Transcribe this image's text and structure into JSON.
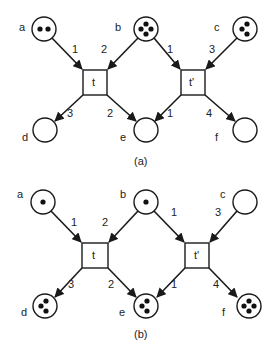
{
  "diagram": {
    "type": "petri-net",
    "colors": {
      "stroke": "#1a1a1a",
      "token": "#111111",
      "background": "#ffffff"
    },
    "panels": [
      {
        "caption": "(a)",
        "places": [
          {
            "id": "a",
            "label": "a",
            "tokens": 2
          },
          {
            "id": "b",
            "label": "b",
            "tokens": 4
          },
          {
            "id": "c",
            "label": "c",
            "tokens": 3
          },
          {
            "id": "d",
            "label": "d",
            "tokens": 0
          },
          {
            "id": "e",
            "label": "e",
            "tokens": 0
          },
          {
            "id": "f",
            "label": "f",
            "tokens": 0
          }
        ],
        "transitions": [
          {
            "id": "t",
            "label": "t"
          },
          {
            "id": "t2",
            "label": "t'"
          }
        ],
        "arcs": [
          {
            "from": "a",
            "to": "t",
            "weight": "1"
          },
          {
            "from": "b",
            "to": "t",
            "weight": "2"
          },
          {
            "from": "b",
            "to": "t2",
            "weight": "1"
          },
          {
            "from": "c",
            "to": "t2",
            "weight": "3"
          },
          {
            "from": "t",
            "to": "d",
            "weight": "3"
          },
          {
            "from": "t",
            "to": "e",
            "weight": "2"
          },
          {
            "from": "t2",
            "to": "e",
            "weight": "1"
          },
          {
            "from": "t2",
            "to": "f",
            "weight": "4"
          }
        ]
      },
      {
        "caption": "(b)",
        "places": [
          {
            "id": "a",
            "label": "a",
            "tokens": 1
          },
          {
            "id": "b",
            "label": "b",
            "tokens": 1
          },
          {
            "id": "c",
            "label": "c",
            "tokens": 0
          },
          {
            "id": "d",
            "label": "d",
            "tokens": 3
          },
          {
            "id": "e",
            "label": "e",
            "tokens": 3
          },
          {
            "id": "f",
            "label": "f",
            "tokens": 4
          }
        ],
        "transitions": [
          {
            "id": "t",
            "label": "t"
          },
          {
            "id": "t2",
            "label": "t'"
          }
        ],
        "arcs": [
          {
            "from": "a",
            "to": "t",
            "weight": "1"
          },
          {
            "from": "b",
            "to": "t",
            "weight": "2"
          },
          {
            "from": "b",
            "to": "t2",
            "weight": "1"
          },
          {
            "from": "c",
            "to": "t2",
            "weight": "3"
          },
          {
            "from": "t",
            "to": "d",
            "weight": "3"
          },
          {
            "from": "t",
            "to": "e",
            "weight": "2"
          },
          {
            "from": "t2",
            "to": "e",
            "weight": "1"
          },
          {
            "from": "t2",
            "to": "f",
            "weight": "4"
          }
        ]
      }
    ]
  }
}
